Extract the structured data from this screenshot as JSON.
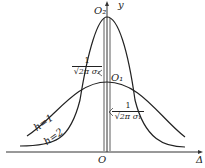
{
  "diagram": {
    "title": "",
    "axes": {
      "x_label": "Δ",
      "y_label": "y",
      "origin_label": "O"
    },
    "curves": [
      {
        "name": "h=1",
        "label": "h=1",
        "peak_label": "O₁",
        "peak_value_num": "1",
        "peak_value_den": "√2π σ₁",
        "shape": "wide"
      },
      {
        "name": "h=2",
        "label": "h=2",
        "peak_label": "O₂",
        "peak_value_num": "1",
        "peak_value_den": "√2π σ₂",
        "shape": "narrow"
      }
    ],
    "colors": {
      "line": "#222222",
      "background": "#ffffff"
    }
  }
}
